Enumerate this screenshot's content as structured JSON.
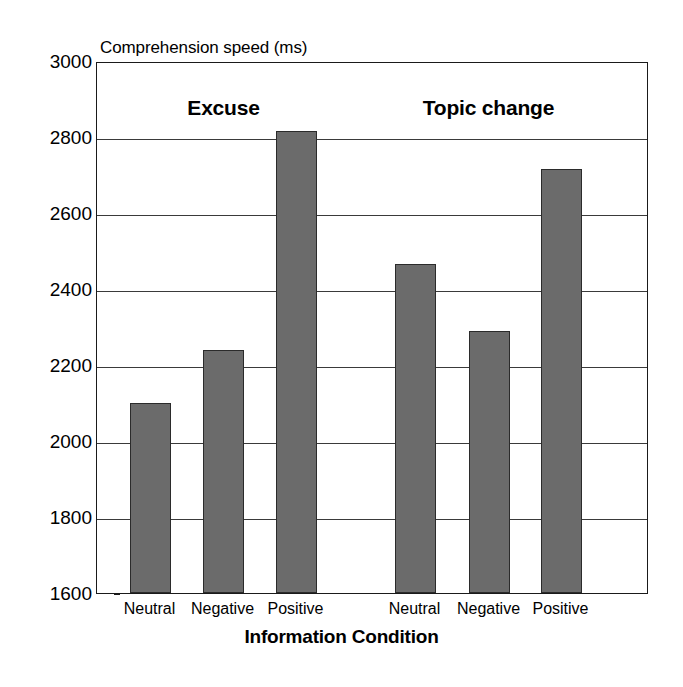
{
  "chart_data": {
    "type": "bar",
    "title": "Comprehension speed (ms)",
    "xlabel": "Information Condition",
    "ylabel": "Comprehension speed (ms)",
    "ylim": [
      1600,
      3000
    ],
    "ytick_step": 200,
    "yticks": [
      3000,
      2800,
      2600,
      2400,
      2200,
      2000,
      1800,
      1600
    ],
    "ytick_labels": [
      "3000",
      "2800",
      "2600",
      "2400",
      "2200",
      "2000",
      "1800",
      "1600"
    ],
    "grid": true,
    "legend": "none",
    "bar_color": "#6b6b6b",
    "bar_edge_color": "#2b2b2b",
    "groups": [
      {
        "name": "Excuse",
        "categories": [
          "Neutral",
          "Negative",
          "Positive"
        ],
        "values": [
          2100,
          2240,
          2815
        ]
      },
      {
        "name": "Topic change",
        "categories": [
          "Neutral",
          "Negative",
          "Positive"
        ],
        "values": [
          2465,
          2290,
          2715
        ]
      }
    ],
    "categories": [
      "Neutral",
      "Negative",
      "Positive",
      "Neutral",
      "Negative",
      "Positive"
    ],
    "values": [
      2100,
      2240,
      2815,
      2465,
      2290,
      2715
    ]
  },
  "axis": {
    "top_title": "Comprehension speed (ms)",
    "bottom_title": "Information Condition"
  },
  "group_labels": {
    "left": "Excuse",
    "right": "Topic change"
  },
  "ytick_labels": {
    "t0": "3000",
    "t1": "2800",
    "t2": "2600",
    "t3": "2400",
    "t4": "2200",
    "t5": "2000",
    "t6": "1800",
    "t7": "1600"
  },
  "xtick_labels": {
    "b0": "Neutral",
    "b1": "Negative",
    "b2": "Positive",
    "b3": "Neutral",
    "b4": "Negative",
    "b5": "Positive"
  }
}
